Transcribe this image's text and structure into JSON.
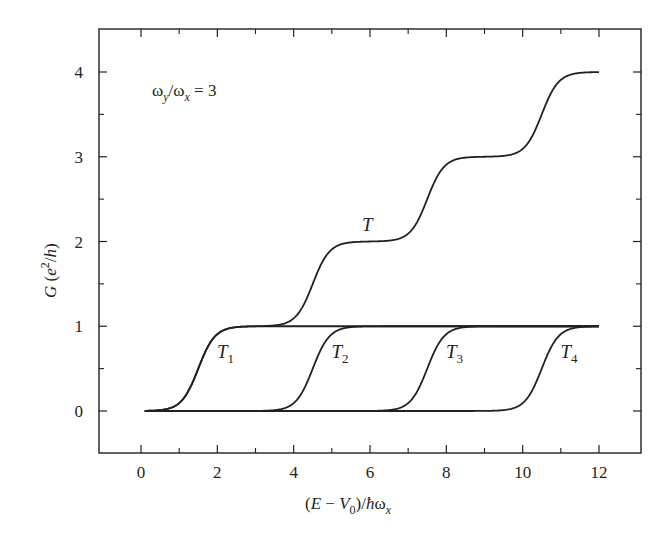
{
  "chart_data": {
    "type": "line",
    "title": "",
    "annotation": {
      "text": "ω_y/ω_x = 3",
      "parts": {
        "omega1": "ω",
        "sub1": "y",
        "slash": "/",
        "omega2": "ω",
        "sub2": "x",
        "eq": " = 3"
      }
    },
    "xlabel": "(E − V0)/ħωx",
    "xlabel_parts": {
      "open": "(",
      "E": "E",
      "minus": " − ",
      "V": "V",
      "sub0": "0",
      "close": ")/",
      "hbar": "ħ",
      "omega": "ω",
      "subx": "x"
    },
    "ylabel": "G (e²/h)",
    "ylabel_parts": {
      "G": "G",
      "open": " (",
      "e": "e",
      "sup": "2",
      "slash": "/",
      "h": "h",
      "close": ")"
    },
    "xlim": [
      -1.1,
      13.1
    ],
    "ylim": [
      -0.5,
      4.5
    ],
    "xticks": [
      0,
      2,
      4,
      6,
      8,
      10,
      12
    ],
    "xticks_minor": [
      1,
      3,
      5,
      7,
      9,
      11
    ],
    "yticks": [
      0,
      1,
      2,
      3,
      4
    ],
    "yticks_minor": [
      0.5,
      1.5,
      2.5,
      3.5
    ],
    "grid": false,
    "legend": "inline labels",
    "x_range_plotted": [
      0.1,
      12
    ],
    "series": [
      {
        "name": "T1",
        "label": "T",
        "sub": "1",
        "step_center": 1.5,
        "plateau": 1,
        "label_pos": [
          2.2,
          0.7
        ]
      },
      {
        "name": "T2",
        "label": "T",
        "sub": "2",
        "step_center": 4.5,
        "plateau": 1,
        "label_pos": [
          5.2,
          0.7
        ]
      },
      {
        "name": "T3",
        "label": "T",
        "sub": "3",
        "step_center": 7.5,
        "plateau": 1,
        "label_pos": [
          8.2,
          0.7
        ]
      },
      {
        "name": "T4",
        "label": "T",
        "sub": "4",
        "step_center": 10.5,
        "plateau": 1,
        "label_pos": [
          11.2,
          0.7
        ]
      },
      {
        "name": "T",
        "label": "T",
        "sub": "",
        "description": "sum of T1..T4",
        "step_centers": [
          1.5,
          4.5,
          7.5,
          10.5
        ],
        "plateaus": [
          1,
          2,
          3,
          4
        ],
        "label_pos": [
          6.0,
          2.2
        ]
      }
    ],
    "step_width": 0.22,
    "sample_points": {
      "x": [
        0,
        1,
        1.5,
        2,
        3,
        4,
        4.5,
        5,
        6,
        7,
        7.5,
        8,
        9,
        10,
        10.5,
        11,
        12
      ],
      "T": [
        0,
        0.1,
        0.5,
        0.9,
        1.0,
        1.1,
        1.5,
        1.9,
        2.0,
        2.1,
        2.5,
        2.9,
        3.0,
        3.1,
        3.5,
        3.9,
        4.0
      ]
    },
    "line_color": "#231f20"
  }
}
